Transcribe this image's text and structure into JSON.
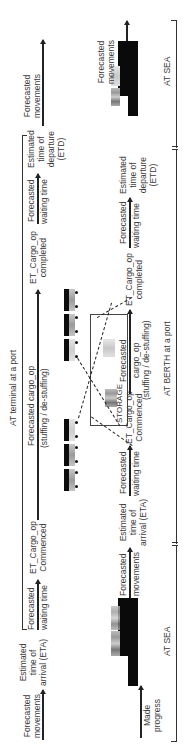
{
  "diagram": {
    "top_row": {
      "bracket_label": "AT terminal at a port",
      "labels": [
        {
          "id": "forecasted_movements_1",
          "text_line1": "Forecasted",
          "text_line2": "movements"
        },
        {
          "id": "eta",
          "text_line1": "Estimated",
          "text_line2": "time of",
          "text_line3": "arrival (ETA)"
        },
        {
          "id": "forecasted_waiting_1",
          "text_line1": "Forecasted",
          "text_line2": "waiting time"
        },
        {
          "id": "et_cargo_commenced",
          "text_line1": "ET_Cargo_op",
          "text_line2": "Commenced"
        },
        {
          "id": "forecasted_cargo_op",
          "text_line1": "Forecasted cargo_op",
          "text_line2": "(stuffing / de-stuffing)"
        },
        {
          "id": "et_cargo_completed",
          "text_line1": "ET_Cargo_op",
          "text_line2": "completed"
        },
        {
          "id": "forecasted_waiting_2",
          "text_line1": "Forecasted",
          "text_line2": "waiting time"
        },
        {
          "id": "etd",
          "text_line1": "Estimated",
          "text_line2": "time of",
          "text_line3": "departure",
          "text_line4": "(ETD)"
        },
        {
          "id": "forecasted_movements_2",
          "text_line1": "Forecasted",
          "text_line2": "movements"
        }
      ]
    },
    "bottom_row": {
      "sections": [
        {
          "label": "AT SEA"
        },
        {
          "label": "AT BERTH at a port"
        },
        {
          "label": "AT SEA"
        }
      ],
      "labels": [
        {
          "id": "made_progress",
          "text_line1": "Made",
          "text_line2": "progress"
        },
        {
          "id": "forecasted_movements_3",
          "text_line1": "Forecasted",
          "text_line2": "movements"
        },
        {
          "id": "eta_2",
          "text_line1": "Estimated",
          "text_line2": "time of",
          "text_line3": "arrival (ETA)"
        },
        {
          "id": "forecasted_waiting_3",
          "text_line1": "Forecasted",
          "text_line2": "waiting time"
        },
        {
          "id": "et_cargo_commenced_2",
          "text_line1": "ET_Cargo_op",
          "text_line2": "Commenced"
        },
        {
          "id": "forecasted_cargo_op_2",
          "text_line1": "Forecasted",
          "text_line2": "cargo_op",
          "text_line3": "(stuffing / de-stuffing)"
        },
        {
          "id": "et_cargo_completed_2",
          "text_line1": "ET_Cargo_op",
          "text_line2": "completed"
        },
        {
          "id": "forecasted_waiting_4",
          "text_line1": "Forecasted",
          "text_line2": "waiting time"
        },
        {
          "id": "etd_2",
          "text_line1": "Estimated",
          "text_line2": "time of",
          "text_line3": "departure",
          "text_line4": "(ETD)"
        },
        {
          "id": "forecasted_movements_4",
          "text_line1": "Forecasted",
          "text_line2": "movements"
        }
      ]
    },
    "storage_label": "STORAGE",
    "colors": {
      "ship_hull": "#0a0a0a",
      "container_grey": "#999999",
      "line": "#333333"
    }
  }
}
